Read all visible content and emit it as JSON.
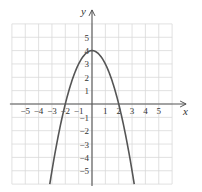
{
  "chart_data": {
    "type": "line",
    "title": "",
    "xlabel": "x",
    "ylabel": "y",
    "xlim": [
      -6,
      6
    ],
    "ylim": [
      -6,
      6
    ],
    "grid": true,
    "legend": null,
    "x_ticks": [
      -5,
      -4,
      -3,
      -2,
      -1,
      1,
      2,
      3,
      4,
      5
    ],
    "y_ticks": [
      -5,
      -4,
      -3,
      -2,
      -1,
      1,
      2,
      3,
      4,
      5
    ],
    "x_tick_labels": [
      "−5",
      "−4",
      "−3",
      "−2",
      "−1",
      "1",
      "2",
      "3",
      "4",
      "5"
    ],
    "y_tick_labels": [
      "−5",
      "−4",
      "−3",
      "−2",
      "−1",
      "1",
      "2",
      "3",
      "4",
      "5"
    ],
    "series": [
      {
        "name": "y = 4 − x²",
        "equation": "y = 4 - x^2",
        "x": [
          -3.16,
          -3,
          -2.5,
          -2,
          -1.5,
          -1,
          -0.5,
          0,
          0.5,
          1,
          1.5,
          2,
          2.5,
          3,
          3.16
        ],
        "y": [
          -6,
          -5,
          -2.25,
          0,
          1.75,
          3,
          3.75,
          4,
          3.75,
          3,
          1.75,
          0,
          -2.25,
          -5,
          -6
        ]
      }
    ],
    "key_points": {
      "vertex": [
        0,
        4
      ],
      "x_intercepts": [
        [
          -2,
          0
        ],
        [
          2,
          0
        ]
      ],
      "y_intercept": [
        0,
        4
      ]
    }
  },
  "colors": {
    "grid": "#d9d9d9",
    "axis": "#555555",
    "curve": "#555555",
    "text": "#333333"
  }
}
